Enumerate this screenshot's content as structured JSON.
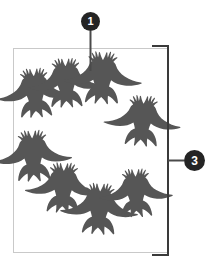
{
  "figure": {
    "background_color": "#ffffff",
    "frame": {
      "name": "image-frame",
      "x": 13,
      "y": 48,
      "width": 154,
      "height": 204,
      "stroke_color": "#c9c9c9",
      "stroke_width": 1
    },
    "bracket": {
      "name": "right-bracket",
      "x_spine": 168,
      "y_top": 46,
      "y_bottom": 255,
      "arm_length": 16,
      "stroke_color": "#3a3a3a",
      "stroke_width": 2
    },
    "leader_lines": [
      {
        "name": "leader-line-1",
        "from": "badge-1",
        "x1": 90.5,
        "y1": 31,
        "x2": 90.5,
        "y2": 71,
        "stroke_color": "#4a4a4a",
        "stroke_width": 2
      },
      {
        "name": "leader-line-3",
        "from": "badge-3",
        "x1": 168,
        "y1": 160.5,
        "x2": 184,
        "y2": 160.5,
        "stroke_color": "#4a4a4a",
        "stroke_width": 2
      }
    ]
  },
  "callouts": [
    {
      "id": "badge-1",
      "label": "1",
      "target": "single-bird-in-flock",
      "circle_color": "#242424",
      "text_color": "#ffffff",
      "cx": 90.5,
      "cy": 21.5,
      "r": 9.5
    },
    {
      "id": "badge-3",
      "label": "3",
      "target": "entire-flock-group",
      "circle_color": "#242424",
      "text_color": "#ffffff",
      "cx": 194.5,
      "cy": 160.5,
      "r": 10.5
    }
  ],
  "birds": {
    "name": "bird-flock",
    "count": 8,
    "silhouette_color": "#565656",
    "species_glyph": "raven-silhouette",
    "arrangement": "ring",
    "items": [
      {
        "id": "bird-1",
        "cx": 35,
        "cy": 95,
        "scale": 1.0,
        "rotate": -4
      },
      {
        "id": "bird-2",
        "cx": 66,
        "cy": 85,
        "scale": 1.0,
        "rotate": -2
      },
      {
        "id": "bird-3",
        "cx": 102,
        "cy": 80,
        "scale": 1.06,
        "rotate": 2
      },
      {
        "id": "bird-4",
        "cx": 142,
        "cy": 123,
        "scale": 1.03,
        "rotate": 4
      },
      {
        "id": "bird-5",
        "cx": 33,
        "cy": 158,
        "scale": 1.04,
        "rotate": -3
      },
      {
        "id": "bird-6",
        "cx": 63,
        "cy": 190,
        "scale": 1.02,
        "rotate": 2
      },
      {
        "id": "bird-7",
        "cx": 99,
        "cy": 211,
        "scale": 1.04,
        "rotate": 3
      },
      {
        "id": "bird-8",
        "cx": 136,
        "cy": 195,
        "scale": 0.98,
        "rotate": -2
      }
    ]
  }
}
